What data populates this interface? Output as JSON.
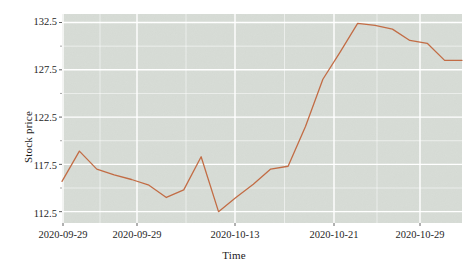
{
  "chart_data": {
    "type": "line",
    "title": "",
    "xlabel": "Time",
    "ylabel": "Stock price",
    "x_tick_labels": [
      "2020-09-29",
      "2020-09-29",
      "2020-10-13",
      "2020-10-21",
      "2020-10-29"
    ],
    "x_tick_positions": [
      63,
      137,
      235,
      334,
      420
    ],
    "y_tick_labels": [
      "112.5",
      "117.5",
      "122.5",
      "127.5",
      "132.5"
    ],
    "y_ticks": [
      112.5,
      117.5,
      122.5,
      127.5,
      132.5
    ],
    "ylim": [
      111.3,
      133.4
    ],
    "grid": true,
    "legend": "none",
    "panel_background": "#d7dcd6",
    "grid_color": "#ffffff",
    "line_color": "#c1663d",
    "line_width": 1.3,
    "series": [
      {
        "name": "Stock price",
        "x": [
          "2020-09-29",
          "2020-09-30",
          "2020-10-01",
          "2020-10-02",
          "2020-10-05",
          "2020-10-06",
          "2020-10-07",
          "2020-10-08",
          "2020-10-09",
          "2020-10-12",
          "2020-10-13",
          "2020-10-14",
          "2020-10-15",
          "2020-10-16",
          "2020-10-19",
          "2020-10-20",
          "2020-10-21",
          "2020-10-22",
          "2020-10-23",
          "2020-10-26",
          "2020-10-27",
          "2020-10-28",
          "2020-10-29",
          "2020-10-30"
        ],
        "values": [
          115.7,
          118.9,
          117.0,
          116.4,
          115.9,
          115.3,
          114.0,
          114.8,
          118.3,
          112.5,
          114.0,
          115.4,
          117.0,
          117.3,
          121.5,
          126.5,
          129.4,
          132.4,
          132.2,
          131.8,
          130.6,
          130.3,
          128.5,
          128.5
        ]
      }
    ]
  }
}
